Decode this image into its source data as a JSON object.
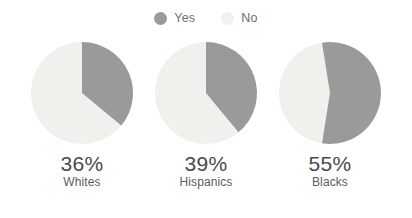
{
  "chart_data": {
    "type": "pie",
    "title": "",
    "subtitle": "",
    "xlabel": "",
    "ylabel": "",
    "legend_position": "top-center",
    "grid": false,
    "legend": [
      {
        "name": "Yes",
        "color": "#9a9a9a"
      },
      {
        "name": "No",
        "color": "#f1f0ed"
      }
    ],
    "categories": [
      "Whites",
      "Hispanics",
      "Blacks"
    ],
    "series": [
      {
        "name": "Yes",
        "values": [
          36,
          39,
          55
        ],
        "color": "#9a9a9a"
      },
      {
        "name": "No",
        "values": [
          64,
          61,
          45
        ],
        "color": "#f1f0ed"
      }
    ],
    "charts": [
      {
        "group": "Whites",
        "value_label": "36%",
        "yes": 36,
        "no": 64,
        "start_angle_deg": 0,
        "rotation_deg": 0
      },
      {
        "group": "Hispanics",
        "value_label": "39%",
        "yes": 39,
        "no": 61,
        "start_angle_deg": 0,
        "rotation_deg": 0
      },
      {
        "group": "Blacks",
        "value_label": "55%",
        "yes": 55,
        "no": 45,
        "start_angle_deg": 0,
        "rotation_deg": -9
      }
    ],
    "value_suffix": "%"
  },
  "colors": {
    "background": "#ffffff",
    "yes_slice": "#9a9a9a",
    "no_slice": "#f1f0ed",
    "value_text": "#4a4a4a",
    "label_text": "#5c5c5c",
    "legend_text": "#6f6f6f"
  }
}
